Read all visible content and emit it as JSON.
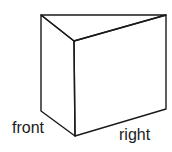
{
  "diagram": {
    "shape": "triangular-prism",
    "labels": {
      "front": "front",
      "right": "right"
    },
    "colors": {
      "stroke": "#1a1a1a",
      "background": "#ffffff"
    }
  }
}
